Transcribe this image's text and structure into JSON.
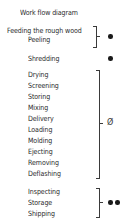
{
  "title": "Work flow diagram",
  "groups": [
    {
      "items": [
        "Feeding the rough wood",
        "Peeling"
      ],
      "symbol": "filled-dot"
    },
    {
      "items": [
        "Shredding"
      ],
      "symbol": "filled-dot"
    },
    {
      "items": [
        "Drying",
        "Screening",
        "Storing",
        "Mixing",
        "Delivery",
        "Loading",
        "Molding",
        "Ejecting",
        "Removing",
        "Deflashing"
      ],
      "symbol": "empty-set",
      "symbol_text": "Ø"
    },
    {
      "items": [
        "Inspecting",
        "Storage",
        "Shipping"
      ],
      "symbol": "double-filled-dot"
    }
  ]
}
